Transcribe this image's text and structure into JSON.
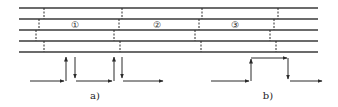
{
  "diagram": {
    "type": "strip-layout-with-seams",
    "lines": {
      "x_start": 19,
      "x_end": 318,
      "y": [
        8,
        19,
        30,
        41,
        52
      ],
      "color": "#3a3a3a"
    },
    "seam_groups": [
      {
        "x": [
          44,
          39,
          36,
          44
        ]
      },
      {
        "x": [
          122,
          119,
          114,
          120
        ]
      },
      {
        "x": [
          202,
          199,
          195,
          201
        ]
      },
      {
        "x": [
          278,
          274,
          270,
          276
        ]
      }
    ],
    "sections": [
      {
        "label": "①",
        "x": 75,
        "y": 24
      },
      {
        "label": "②",
        "x": 157,
        "y": 24
      },
      {
        "label": "③",
        "x": 235,
        "y": 24
      }
    ],
    "subfigures": [
      {
        "id": "a",
        "caption": "a)",
        "caption_pos": {
          "x": 95,
          "y": 99
        },
        "arrows": [
          {
            "from": [
              30,
              81
            ],
            "to": [
              64,
              81
            ]
          },
          {
            "from": [
              66,
              81
            ],
            "to": [
              66,
              57
            ]
          },
          {
            "from": [
              75,
              57
            ],
            "to": [
              75,
              78
            ]
          },
          {
            "from": [
              76,
              81
            ],
            "to": [
              112,
              81
            ]
          },
          {
            "from": [
              114,
              81
            ],
            "to": [
              114,
              57
            ]
          },
          {
            "from": [
              122,
              57
            ],
            "to": [
              122,
              78
            ]
          },
          {
            "from": [
              123,
              81
            ],
            "to": [
              163,
              81
            ]
          }
        ]
      },
      {
        "id": "b",
        "caption": "b)",
        "caption_pos": {
          "x": 268,
          "y": 99
        },
        "arrows": [
          {
            "from": [
              211,
              81
            ],
            "to": [
              249,
              81
            ]
          },
          {
            "from": [
              251,
              81
            ],
            "to": [
              251,
              59
            ]
          },
          {
            "from": [
              251,
              58
            ],
            "to": [
              287,
              58
            ]
          },
          {
            "from": [
              288,
              58
            ],
            "to": [
              288,
              79
            ]
          },
          {
            "from": [
              290,
              81
            ],
            "to": [
              322,
              81
            ]
          }
        ]
      }
    ]
  }
}
